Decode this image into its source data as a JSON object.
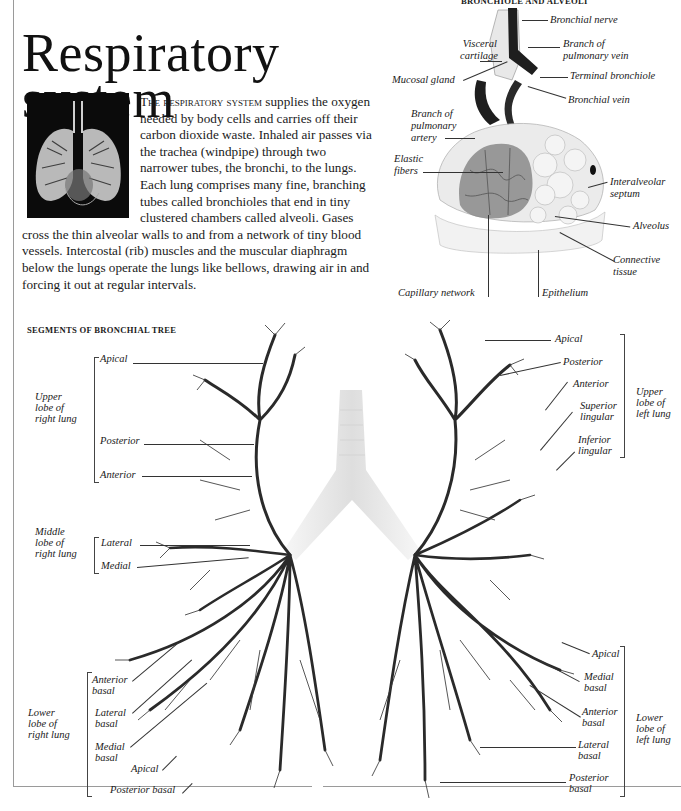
{
  "page": {
    "title_line1": "Respiratory",
    "title_line2": "system"
  },
  "intro": {
    "lead_smallcaps": "The respiratory system",
    "body": " supplies the oxygen needed by body cells and carries off their carbon dioxide waste. Inhaled air passes via the trachea (windpipe) through two narrower tubes, the bronchi, to the lungs. Each lung comprises many fine, branching tubes called bronchioles that end in tiny clustered chambers called alveoli. Gases cross the thin alveolar walls to and from a network of tiny blood vessels. Intercostal (rib) muscles and the muscular diaphragm below the lungs operate the lungs like bellows, drawing air in and forcing it out at regular intervals."
  },
  "bronchiole_figure": {
    "heading": "BRONCHIOLE AND ALVEOLI",
    "labels": {
      "bronchial_nerve": "Bronchial nerve",
      "visceral_cartilage_1": "Visceral",
      "visceral_cartilage_2": "cartilage",
      "branch_pulmonary_vein_1": "Branch of",
      "branch_pulmonary_vein_2": "pulmonary vein",
      "mucosal_gland": "Mucosal gland",
      "terminal_bronchiole": "Terminal bronchiole",
      "bronchial_vein": "Bronchial vein",
      "branch_pulmonary_artery_1": "Branch of",
      "branch_pulmonary_artery_2": "pulmonary",
      "branch_pulmonary_artery_3": "artery",
      "elastic_fibers_1": "Elastic",
      "elastic_fibers_2": "fibers",
      "interalveolar_septum_1": "Interalveolar",
      "interalveolar_septum_2": "septum",
      "alveolus": "Alveolus",
      "connective_tissue_1": "Connective",
      "connective_tissue_2": "tissue",
      "capillary_network": "Capillary network",
      "epithelium": "Epithelium"
    }
  },
  "bronchial_tree": {
    "heading": "SEGMENTS OF BRONCHIAL TREE",
    "right_lung": {
      "upper_lobe": [
        "Upper",
        "lobe of",
        "right lung"
      ],
      "upper_segments": [
        "Apical",
        "Posterior",
        "Anterior"
      ],
      "middle_lobe": [
        "Middle",
        "lobe of",
        "right lung"
      ],
      "middle_segments": [
        "Lateral",
        "Medial"
      ],
      "lower_lobe": [
        "Lower",
        "lobe of",
        "right lung"
      ],
      "lower_segments": {
        "anterior_basal": [
          "Anterior",
          "basal"
        ],
        "lateral_basal": [
          "Lateral",
          "basal"
        ],
        "medial_basal": [
          "Medial",
          "basal"
        ],
        "apical": "Apical",
        "posterior_basal": "Posterior basal"
      }
    },
    "left_lung": {
      "upper_lobe": [
        "Upper",
        "lobe of",
        "left lung"
      ],
      "upper_segments": {
        "apical": "Apical",
        "posterior": "Posterior",
        "anterior": "Anterior",
        "superior_lingular": [
          "Superior",
          "lingular"
        ],
        "inferior_lingular": [
          "Inferior",
          "lingular"
        ]
      },
      "lower_lobe": [
        "Lower",
        "lobe of",
        "left lung"
      ],
      "lower_segments": {
        "apical": "Apical",
        "medial_basal": [
          "Medial",
          "basal"
        ],
        "anterior_basal": [
          "Anterior",
          "basal"
        ],
        "lateral_basal": [
          "Lateral",
          "basal"
        ],
        "posterior_basal": [
          "Posterior",
          "basal"
        ]
      }
    }
  },
  "colors": {
    "text": "#1a1a1a",
    "frame": "#9a9a9a",
    "vessel_dark": "#1e1e1e",
    "tissue_light": "#e6e6e6"
  }
}
